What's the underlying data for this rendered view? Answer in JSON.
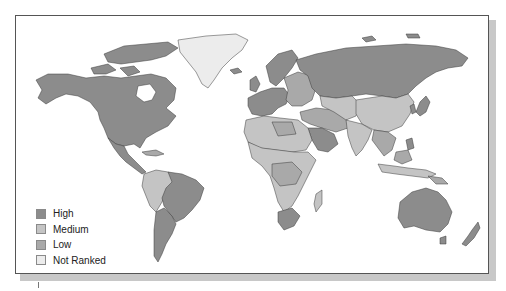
{
  "map": {
    "type": "world choropleth",
    "colors": {
      "high": "#8c8c8c",
      "medium": "#c4c4c4",
      "low": "#a9a9a9",
      "not_ranked": "#ececec",
      "border": "#3a3a3a",
      "ocean": "#ffffff"
    }
  },
  "legend": {
    "items": [
      {
        "key": "high",
        "label": "High",
        "color": "#8c8c8c"
      },
      {
        "key": "medium",
        "label": "Medium",
        "color": "#c4c4c4"
      },
      {
        "key": "low",
        "label": "Low",
        "color": "#a9a9a9"
      },
      {
        "key": "not_ranked",
        "label": "Not Ranked",
        "color": "#ececec"
      }
    ]
  },
  "regions": [
    {
      "name": "North America (Canada, USA, Mexico)",
      "category": "high"
    },
    {
      "name": "Greenland",
      "category": "not_ranked"
    },
    {
      "name": "Central America",
      "category": "high"
    },
    {
      "name": "Northern South America",
      "category": "medium"
    },
    {
      "name": "Brazil",
      "category": "high"
    },
    {
      "name": "Southern South America",
      "category": "high"
    },
    {
      "name": "Western Europe",
      "category": "high"
    },
    {
      "name": "Eastern Europe",
      "category": "low"
    },
    {
      "name": "Russia",
      "category": "high"
    },
    {
      "name": "North Africa",
      "category": "medium"
    },
    {
      "name": "Sub-Saharan Africa",
      "category": "medium"
    },
    {
      "name": "South Africa",
      "category": "high"
    },
    {
      "name": "Middle East",
      "category": "low"
    },
    {
      "name": "Arabian Peninsula",
      "category": "high"
    },
    {
      "name": "Central Asia",
      "category": "medium"
    },
    {
      "name": "China",
      "category": "medium"
    },
    {
      "name": "India",
      "category": "medium"
    },
    {
      "name": "Japan",
      "category": "high"
    },
    {
      "name": "Southeast Asia",
      "category": "low"
    },
    {
      "name": "Indonesia",
      "category": "medium"
    },
    {
      "name": "Australia",
      "category": "high"
    },
    {
      "name": "New Zealand",
      "category": "high"
    }
  ]
}
